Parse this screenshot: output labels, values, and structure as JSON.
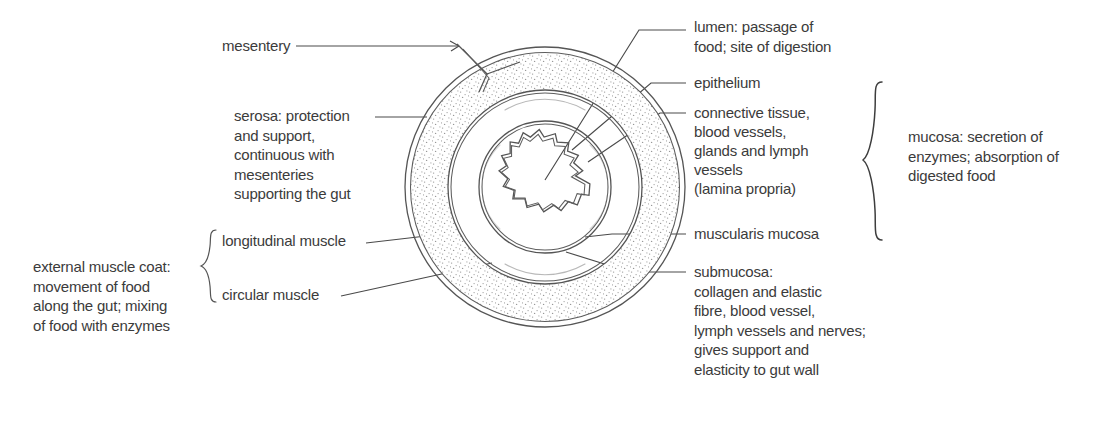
{
  "diagram": {
    "labels": {
      "mesentery": "mesentery",
      "serosa": "serosa: protection\nand support,\ncontinuous with\nmesenteries\nsupporting the gut",
      "longitudinal_muscle": "longitudinal muscle",
      "circular_muscle": "circular muscle",
      "external_muscle_coat": "external muscle coat:\nmovement of food\nalong the gut; mixing\nof food with enzymes",
      "lumen": "lumen: passage of\nfood; site of digestion",
      "epithelium": "epithelium",
      "connective_tissue": "connective tissue,\nblood vessels,\nglands and lymph\nvessels\n(lamina propria)",
      "muscularis_mucosa": "muscularis mucosa",
      "submucosa": "submucosa:\ncollagen and elastic\nfibre, blood vessel,\nlymph vessels and nerves;\ngives support and\nelasticity to gut wall",
      "mucosa": "mucosa: secretion of\nenzymes; absorption of\ndigested food"
    },
    "colors": {
      "background": "#ffffff",
      "text": "#3b3b3b",
      "line": "#4a4a4a",
      "ring_stroke": "#555555",
      "stipple": "#9a9a9a",
      "hatch": "#8d8d8d"
    },
    "geometry": {
      "center_x": 545,
      "center_y": 187,
      "outer_radius": 140
    }
  }
}
